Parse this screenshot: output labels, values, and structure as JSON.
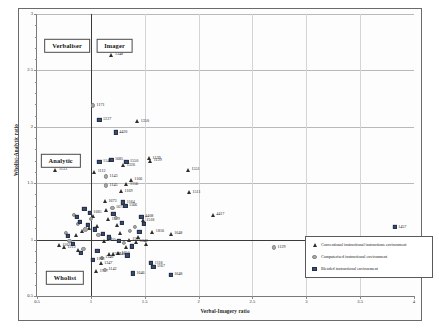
{
  "chart_data": {
    "type": "scatter",
    "title": "",
    "xlabel": "Verbal-Imagery ratio",
    "ylabel": "Wholist-Analytic ratio",
    "xlim": [
      0.5,
      4
    ],
    "ylim": [
      0.5,
      3
    ],
    "xticks": [
      "0.5",
      "1",
      "1.5",
      "2",
      "2.5",
      "3",
      "3.5",
      "4"
    ],
    "yticks": [
      "0.5",
      "1",
      "1.5",
      "2",
      "2.5",
      "3"
    ],
    "xtick_values": [
      0.5,
      1,
      1.5,
      2,
      2.5,
      3,
      3.5,
      4
    ],
    "ytick_values": [
      0.5,
      1,
      1.5,
      2,
      2.5,
      3
    ],
    "grid": true,
    "reference_lines": {
      "x": 1.0,
      "y": 1.0
    },
    "legend_position": "bottom-right",
    "quadrant_labels": [
      {
        "text": "Verbaliser",
        "x": 0.78,
        "y": 2.72
      },
      {
        "text": "Imager",
        "x": 1.22,
        "y": 2.72
      },
      {
        "text": "Analytic",
        "x": 0.72,
        "y": 1.7
      },
      {
        "text": "Wholist",
        "x": 0.76,
        "y": 0.66
      }
    ],
    "series": [
      {
        "name": "Conventional instructional instructions environment",
        "marker": "triangle",
        "color": "#2e2e2e",
        "points": [
          {
            "x": 1.19,
            "y": 2.64,
            "label": "1348"
          },
          {
            "x": 1.43,
            "y": 2.05,
            "label": "1350"
          },
          {
            "x": 1.54,
            "y": 1.72,
            "label": "1139"
          },
          {
            "x": 1.55,
            "y": 1.7,
            "label": "1129"
          },
          {
            "x": 0.67,
            "y": 1.62,
            "label": "1133"
          },
          {
            "x": 1.03,
            "y": 1.6,
            "label": "1112"
          },
          {
            "x": 1.3,
            "y": 1.66,
            "label": "1326"
          },
          {
            "x": 1.37,
            "y": 1.53,
            "label": "1166"
          },
          {
            "x": 1.33,
            "y": 1.49,
            "label": "1156"
          },
          {
            "x": 1.9,
            "y": 1.62,
            "label": "1551"
          },
          {
            "x": 1.28,
            "y": 1.43,
            "label": "1169"
          },
          {
            "x": 1.91,
            "y": 1.42,
            "label": "1511"
          },
          {
            "x": 1.13,
            "y": 1.34,
            "label": "1673"
          },
          {
            "x": 2.13,
            "y": 1.22,
            "label": "4417"
          },
          {
            "x": 1.48,
            "y": 1.17,
            "label": "1518"
          },
          {
            "x": 1.16,
            "y": 1.18,
            "label": "1319"
          },
          {
            "x": 1.57,
            "y": 1.07,
            "label": "1816"
          },
          {
            "x": 1.74,
            "y": 1.05,
            "label": "1648"
          },
          {
            "x": 1.35,
            "y": 1.0,
            "label": "1501"
          },
          {
            "x": 1.12,
            "y": 0.99,
            "label": "4420"
          },
          {
            "x": 1.42,
            "y": 0.98,
            "label": "1342"
          },
          {
            "x": 0.7,
            "y": 0.95,
            "label": "1102"
          },
          {
            "x": 0.75,
            "y": 0.93,
            "label": "1212"
          },
          {
            "x": 1.25,
            "y": 0.88,
            "label": "1354"
          },
          {
            "x": 1.17,
            "y": 0.87,
            "label": "1346"
          },
          {
            "x": 1.21,
            "y": 0.87,
            "label": "1140"
          },
          {
            "x": 1.09,
            "y": 0.79,
            "label": "1347"
          },
          {
            "x": 1.05,
            "y": 0.72,
            "label": "1997"
          },
          {
            "x": 0.98,
            "y": 1.1,
            "label": ""
          },
          {
            "x": 1.06,
            "y": 1.12,
            "label": ""
          },
          {
            "x": 1.24,
            "y": 1.13,
            "label": ""
          },
          {
            "x": 0.92,
            "y": 1.08,
            "label": ""
          },
          {
            "x": 1.44,
            "y": 1.02,
            "label": ""
          },
          {
            "x": 0.86,
            "y": 1.04,
            "label": ""
          },
          {
            "x": 1.51,
            "y": 0.96,
            "label": ""
          },
          {
            "x": 1.33,
            "y": 0.93,
            "label": ""
          },
          {
            "x": 0.88,
            "y": 0.91,
            "label": ""
          },
          {
            "x": 1.02,
            "y": 1.21,
            "label": ""
          },
          {
            "x": 1.14,
            "y": 1.26,
            "label": ""
          },
          {
            "x": 1.27,
            "y": 1.06,
            "label": ""
          }
        ]
      },
      {
        "name": "Computerised instructional environment",
        "marker": "circle",
        "color": "#a8a8a8",
        "points": [
          {
            "x": 1.02,
            "y": 2.19,
            "label": "1171"
          },
          {
            "x": 1.14,
            "y": 1.56,
            "label": "1143"
          },
          {
            "x": 1.14,
            "y": 1.48,
            "label": "1145"
          },
          {
            "x": 2.7,
            "y": 0.93,
            "label": "1129"
          },
          {
            "x": 1.1,
            "y": 0.84,
            "label": "1340"
          },
          {
            "x": 1.13,
            "y": 0.73,
            "label": "1142"
          },
          {
            "x": 1.2,
            "y": 1.28,
            "label": "1673"
          },
          {
            "x": 0.88,
            "y": 1.14,
            "label": ""
          },
          {
            "x": 0.95,
            "y": 1.09,
            "label": ""
          },
          {
            "x": 1.07,
            "y": 1.04,
            "label": ""
          },
          {
            "x": 1.18,
            "y": 1.01,
            "label": ""
          },
          {
            "x": 0.8,
            "y": 0.99,
            "label": ""
          },
          {
            "x": 1.31,
            "y": 0.97,
            "label": ""
          },
          {
            "x": 0.93,
            "y": 0.92,
            "label": ""
          },
          {
            "x": 1.41,
            "y": 1.11,
            "label": ""
          },
          {
            "x": 1.0,
            "y": 1.18,
            "label": ""
          },
          {
            "x": 0.84,
            "y": 1.22,
            "label": ""
          },
          {
            "x": 1.23,
            "y": 1.19,
            "label": ""
          },
          {
            "x": 1.36,
            "y": 1.08,
            "label": ""
          },
          {
            "x": 0.77,
            "y": 1.06,
            "label": ""
          }
        ]
      },
      {
        "name": "Blended instructional environment",
        "marker": "square",
        "color": "#3d4f6b",
        "points": [
          {
            "x": 1.08,
            "y": 2.06,
            "label": "1227"
          },
          {
            "x": 1.23,
            "y": 1.95,
            "label": "4420"
          },
          {
            "x": 1.19,
            "y": 1.71,
            "label": "1685"
          },
          {
            "x": 1.08,
            "y": 1.69,
            "label": "1146"
          },
          {
            "x": 1.33,
            "y": 1.69,
            "label": "1550"
          },
          {
            "x": 1.32,
            "y": 1.3,
            "label": "1566"
          },
          {
            "x": 1.3,
            "y": 1.33,
            "label": "1164"
          },
          {
            "x": 0.99,
            "y": 1.24,
            "label": "1685"
          },
          {
            "x": 1.47,
            "y": 1.2,
            "label": "4408"
          },
          {
            "x": 1.02,
            "y": 0.82,
            "label": "1103"
          },
          {
            "x": 1.56,
            "y": 0.79,
            "label": "1118"
          },
          {
            "x": 1.58,
            "y": 0.76,
            "label": "1167"
          },
          {
            "x": 1.39,
            "y": 0.7,
            "label": "1646"
          },
          {
            "x": 1.74,
            "y": 0.69,
            "label": "1648"
          },
          {
            "x": 3.13,
            "y": 0.7,
            "label": ""
          },
          {
            "x": 3.82,
            "y": 1.11,
            "label": "1457"
          },
          {
            "x": 0.9,
            "y": 1.16,
            "label": ""
          },
          {
            "x": 0.97,
            "y": 1.13,
            "label": ""
          },
          {
            "x": 1.04,
            "y": 1.09,
            "label": ""
          },
          {
            "x": 1.11,
            "y": 1.05,
            "label": ""
          },
          {
            "x": 1.17,
            "y": 1.02,
            "label": ""
          },
          {
            "x": 1.26,
            "y": 0.99,
            "label": ""
          },
          {
            "x": 0.83,
            "y": 0.96,
            "label": ""
          },
          {
            "x": 1.38,
            "y": 0.94,
            "label": ""
          },
          {
            "x": 0.79,
            "y": 1.03,
            "label": ""
          },
          {
            "x": 1.45,
            "y": 1.07,
            "label": ""
          },
          {
            "x": 0.94,
            "y": 1.27,
            "label": ""
          },
          {
            "x": 1.21,
            "y": 1.23,
            "label": ""
          },
          {
            "x": 1.29,
            "y": 1.15,
            "label": ""
          },
          {
            "x": 0.87,
            "y": 1.2,
            "label": ""
          },
          {
            "x": 1.49,
            "y": 1.14,
            "label": ""
          },
          {
            "x": 1.06,
            "y": 0.9,
            "label": ""
          },
          {
            "x": 1.34,
            "y": 0.86,
            "label": ""
          },
          {
            "x": 0.91,
            "y": 0.88,
            "label": ""
          }
        ]
      }
    ]
  }
}
